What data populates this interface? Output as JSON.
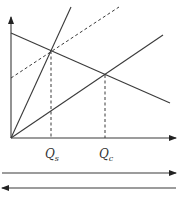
{
  "diagram": {
    "type": "economics-supply-demand",
    "colors": {
      "line": "#3a3a3a",
      "background": "#ffffff"
    },
    "axes": {
      "origin": [
        11,
        138
      ],
      "y_axis_top": [
        11,
        17
      ],
      "x_axis_right": [
        176,
        138
      ]
    },
    "lines": [
      {
        "name": "steep-supply-line",
        "from": [
          11,
          138
        ],
        "to": [
          71,
          7
        ],
        "style": "solid"
      },
      {
        "name": "demand-line",
        "from": [
          11,
          33
        ],
        "to": [
          170,
          103
        ],
        "style": "solid"
      },
      {
        "name": "shallow-supply-line",
        "from": [
          11,
          138
        ],
        "to": [
          163,
          35
        ],
        "style": "solid"
      },
      {
        "name": "shifted-supply-line",
        "from": [
          11,
          78
        ],
        "to": [
          119,
          7
        ],
        "style": "dashed"
      }
    ],
    "labels": {
      "qs": {
        "main": "Q",
        "sub": "s",
        "x": 51
      },
      "qc": {
        "main": "Q",
        "sub": "c",
        "x": 105
      }
    },
    "arrows": [
      {
        "name": "right-arrow",
        "direction": "right",
        "y": 173
      },
      {
        "name": "left-arrow",
        "direction": "left",
        "y": 188
      }
    ]
  }
}
